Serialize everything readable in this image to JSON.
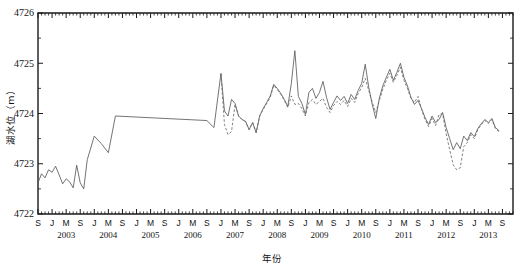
{
  "chart_data": {
    "type": "line",
    "title": "",
    "xlabel": "年份",
    "ylabel": "湖水位（m）",
    "ylim": [
      4722,
      4726
    ],
    "yticks": [
      4722,
      4723,
      4724,
      4725,
      4726
    ],
    "ytick_labels": [
      "4722",
      "4723",
      "4724",
      "4725",
      "4726"
    ],
    "y_minor_interval": 0.5,
    "grid": false,
    "legend_position": "none",
    "x_unit": "month",
    "xlim_months": [
      "2002-09",
      "2013-12"
    ],
    "xtick_labels": [
      "S",
      "J",
      "M",
      "S",
      "J",
      "M",
      "S",
      "J",
      "M",
      "S",
      "J",
      "M",
      "S",
      "J",
      "M",
      "S",
      "J",
      "M",
      "S",
      "J",
      "M",
      "S",
      "J",
      "M",
      "S",
      "J",
      "M",
      "S",
      "J",
      "M",
      "S",
      "J",
      "M",
      "S",
      "J"
    ],
    "year_labels": [
      "2002",
      "2003",
      "2004",
      "2005",
      "2006",
      "2007",
      "2008",
      "2009",
      "2010",
      "2011",
      "2012",
      "2013"
    ],
    "series": [
      {
        "name": "observed",
        "style": "solid",
        "color": "#5b5b5b",
        "points": [
          [
            "2002-09",
            4722.62
          ],
          [
            "2002-10",
            4722.8
          ],
          [
            "2002-11",
            4722.72
          ],
          [
            "2002-12",
            4722.88
          ],
          [
            "2003-01",
            4722.83
          ],
          [
            "2003-02",
            4722.95
          ],
          [
            "2003-03",
            4722.78
          ],
          [
            "2003-04",
            4722.6
          ],
          [
            "2003-05",
            4722.7
          ],
          [
            "2003-06",
            4722.64
          ],
          [
            "2003-07",
            4722.52
          ],
          [
            "2003-08",
            4722.97
          ],
          [
            "2003-09",
            4722.62
          ],
          [
            "2003-10",
            4722.5
          ],
          [
            "2003-11",
            4723.08
          ],
          [
            "2004-01",
            4723.55
          ],
          [
            "2004-03",
            4723.4
          ],
          [
            "2004-05",
            4723.22
          ],
          [
            "2004-07",
            4723.95
          ],
          [
            "2006-09",
            4723.86
          ],
          [
            "2006-11",
            4723.72
          ],
          [
            "2007-01",
            4724.8
          ],
          [
            "2007-02",
            4724.05
          ],
          [
            "2007-03",
            4723.95
          ],
          [
            "2007-04",
            4724.28
          ],
          [
            "2007-05",
            4724.2
          ],
          [
            "2007-06",
            4723.95
          ],
          [
            "2007-07",
            4723.88
          ],
          [
            "2007-08",
            4723.84
          ],
          [
            "2007-09",
            4723.68
          ],
          [
            "2007-10",
            4723.82
          ],
          [
            "2007-11",
            4723.62
          ],
          [
            "2007-12",
            4723.95
          ],
          [
            "2008-01",
            4724.1
          ],
          [
            "2008-02",
            4724.22
          ],
          [
            "2008-03",
            4724.35
          ],
          [
            "2008-04",
            4724.58
          ],
          [
            "2008-05",
            4724.5
          ],
          [
            "2008-06",
            4724.4
          ],
          [
            "2008-07",
            4724.28
          ],
          [
            "2008-08",
            4724.14
          ],
          [
            "2008-09",
            4724.6
          ],
          [
            "2008-10",
            4725.25
          ],
          [
            "2008-11",
            4724.34
          ],
          [
            "2008-12",
            4724.2
          ],
          [
            "2009-01",
            4723.98
          ],
          [
            "2009-02",
            4724.42
          ],
          [
            "2009-03",
            4724.5
          ],
          [
            "2009-04",
            4724.3
          ],
          [
            "2009-05",
            4724.42
          ],
          [
            "2009-06",
            4724.64
          ],
          [
            "2009-07",
            4724.32
          ],
          [
            "2009-08",
            4724.08
          ],
          [
            "2009-09",
            4724.22
          ],
          [
            "2009-10",
            4724.35
          ],
          [
            "2009-11",
            4724.26
          ],
          [
            "2009-12",
            4724.34
          ],
          [
            "2010-01",
            4724.2
          ],
          [
            "2010-02",
            4724.38
          ],
          [
            "2010-03",
            4724.28
          ],
          [
            "2010-04",
            4724.46
          ],
          [
            "2010-05",
            4724.6
          ],
          [
            "2010-06",
            4724.98
          ],
          [
            "2010-07",
            4724.52
          ],
          [
            "2010-08",
            4724.18
          ],
          [
            "2010-09",
            4723.9
          ],
          [
            "2010-10",
            4724.3
          ],
          [
            "2010-11",
            4724.55
          ],
          [
            "2010-12",
            4724.72
          ],
          [
            "2011-01",
            4724.88
          ],
          [
            "2011-02",
            4724.66
          ],
          [
            "2011-03",
            4724.82
          ],
          [
            "2011-04",
            4725.0
          ],
          [
            "2011-05",
            4724.72
          ],
          [
            "2011-06",
            4724.55
          ],
          [
            "2011-07",
            4724.32
          ],
          [
            "2011-08",
            4724.18
          ],
          [
            "2011-09",
            4724.26
          ],
          [
            "2011-10",
            4724.1
          ],
          [
            "2011-11",
            4723.92
          ],
          [
            "2011-12",
            4723.78
          ],
          [
            "2012-01",
            4723.95
          ],
          [
            "2012-02",
            4723.82
          ],
          [
            "2012-03",
            4723.88
          ],
          [
            "2012-04",
            4724.02
          ],
          [
            "2012-05",
            4723.72
          ],
          [
            "2012-06",
            4723.5
          ],
          [
            "2012-07",
            4723.28
          ],
          [
            "2012-08",
            4723.42
          ],
          [
            "2012-09",
            4723.3
          ],
          [
            "2012-10",
            4723.55
          ],
          [
            "2012-11",
            4723.46
          ],
          [
            "2012-12",
            4723.62
          ],
          [
            "2013-01",
            4723.54
          ],
          [
            "2013-02",
            4723.7
          ],
          [
            "2013-03",
            4723.8
          ],
          [
            "2013-04",
            4723.88
          ],
          [
            "2013-05",
            4723.82
          ],
          [
            "2013-06",
            4723.9
          ],
          [
            "2013-07",
            4723.72
          ],
          [
            "2013-08",
            4723.66
          ]
        ]
      },
      {
        "name": "simulated",
        "style": "dashed",
        "color": "#6a6a6a",
        "points": [
          [
            "2007-01",
            4724.78
          ],
          [
            "2007-02",
            4723.78
          ],
          [
            "2007-03",
            4723.58
          ],
          [
            "2007-04",
            4723.64
          ],
          [
            "2007-05",
            4724.18
          ],
          [
            "2007-06",
            4723.95
          ],
          [
            "2007-07",
            4723.88
          ],
          [
            "2007-08",
            4723.84
          ],
          [
            "2007-09",
            4723.68
          ],
          [
            "2007-10",
            4723.82
          ],
          [
            "2007-11",
            4723.62
          ],
          [
            "2007-12",
            4723.95
          ],
          [
            "2008-01",
            4724.08
          ],
          [
            "2008-02",
            4724.2
          ],
          [
            "2008-03",
            4724.32
          ],
          [
            "2008-04",
            4724.56
          ],
          [
            "2008-05",
            4724.48
          ],
          [
            "2008-06",
            4724.38
          ],
          [
            "2008-07",
            4724.26
          ],
          [
            "2008-08",
            4724.12
          ],
          [
            "2008-09",
            4724.35
          ],
          [
            "2008-10",
            4724.18
          ],
          [
            "2008-11",
            4724.2
          ],
          [
            "2008-12",
            4724.1
          ],
          [
            "2009-01",
            4723.95
          ],
          [
            "2009-02",
            4724.22
          ],
          [
            "2009-03",
            4724.28
          ],
          [
            "2009-04",
            4724.18
          ],
          [
            "2009-05",
            4724.24
          ],
          [
            "2009-06",
            4724.3
          ],
          [
            "2009-07",
            4724.12
          ],
          [
            "2009-08",
            4724.02
          ],
          [
            "2009-09",
            4724.16
          ],
          [
            "2009-10",
            4724.24
          ],
          [
            "2009-11",
            4724.18
          ],
          [
            "2009-12",
            4724.26
          ],
          [
            "2010-01",
            4724.14
          ],
          [
            "2010-02",
            4724.3
          ],
          [
            "2010-03",
            4724.22
          ],
          [
            "2010-04",
            4724.4
          ],
          [
            "2010-05",
            4724.52
          ],
          [
            "2010-06",
            4724.7
          ],
          [
            "2010-07",
            4724.46
          ],
          [
            "2010-08",
            4724.22
          ],
          [
            "2010-09",
            4724.02
          ],
          [
            "2010-10",
            4724.26
          ],
          [
            "2010-11",
            4724.48
          ],
          [
            "2010-12",
            4724.66
          ],
          [
            "2011-01",
            4724.8
          ],
          [
            "2011-02",
            4724.62
          ],
          [
            "2011-03",
            4724.76
          ],
          [
            "2011-04",
            4724.92
          ],
          [
            "2011-05",
            4724.66
          ],
          [
            "2011-06",
            4724.5
          ],
          [
            "2011-07",
            4724.3
          ],
          [
            "2011-08",
            4724.22
          ],
          [
            "2011-09",
            4724.34
          ],
          [
            "2011-10",
            4724.08
          ],
          [
            "2011-11",
            4723.88
          ],
          [
            "2011-12",
            4723.74
          ],
          [
            "2012-01",
            4723.9
          ],
          [
            "2012-02",
            4723.76
          ],
          [
            "2012-03",
            4723.98
          ],
          [
            "2012-04",
            4724.0
          ],
          [
            "2012-05",
            4723.6
          ],
          [
            "2012-06",
            4723.28
          ],
          [
            "2012-07",
            4722.98
          ],
          [
            "2012-08",
            4722.88
          ],
          [
            "2012-09",
            4722.92
          ],
          [
            "2012-10",
            4723.34
          ],
          [
            "2012-11",
            4723.42
          ],
          [
            "2012-12",
            4723.58
          ],
          [
            "2013-01",
            4723.5
          ],
          [
            "2013-02",
            4723.68
          ],
          [
            "2013-03",
            4723.78
          ],
          [
            "2013-04",
            4723.86
          ],
          [
            "2013-05",
            4723.8
          ],
          [
            "2013-06",
            4723.88
          ],
          [
            "2013-07",
            4723.7
          ],
          [
            "2013-08",
            4723.64
          ]
        ]
      }
    ]
  }
}
